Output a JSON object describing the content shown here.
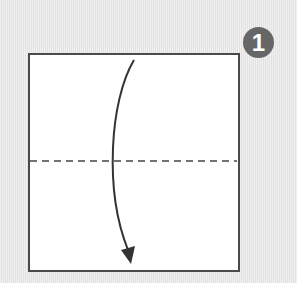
{
  "diagram": {
    "type": "origami-step",
    "step": {
      "number": "1",
      "badge_color": "#666666",
      "badge_text_color": "#ffffff"
    },
    "paper": {
      "shape": "square",
      "fill": "#ffffff",
      "border_color": "#4a4a4a"
    },
    "fold_line": {
      "style": "dashed",
      "kind": "valley-fold",
      "orientation": "horizontal",
      "position": "middle"
    },
    "arrow": {
      "direction": "down",
      "meaning": "fold top edge down to bottom edge",
      "color": "#333333"
    },
    "background_color": "#e9e9e9"
  }
}
